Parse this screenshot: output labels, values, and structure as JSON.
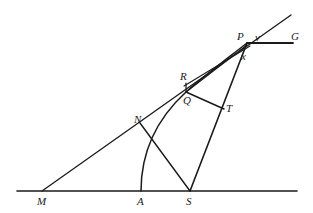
{
  "diagram": {
    "type": "geometric-construction",
    "labels": {
      "P": "P",
      "v": "v",
      "G": "G",
      "x": "x",
      "R": "R",
      "Q": "Q",
      "T": "T",
      "N": "N",
      "M": "M",
      "A": "A",
      "S": "S"
    },
    "points": {
      "M": [
        42,
        191
      ],
      "A": [
        141,
        191
      ],
      "S": [
        190,
        191
      ],
      "N": [
        140,
        126
      ],
      "R": [
        186,
        81
      ],
      "Q": [
        186,
        92
      ],
      "T": [
        224,
        109
      ],
      "P": [
        247,
        43
      ],
      "G": [
        293,
        43
      ],
      "x": [
        240,
        52
      ]
    },
    "segments": [
      {
        "name": "baseline",
        "from": [
          17,
          191
        ],
        "to": [
          297,
          191
        ]
      },
      {
        "name": "tangent-MP",
        "from": [
          42,
          191
        ],
        "to": [
          291,
          15
        ]
      },
      {
        "name": "PG",
        "from": [
          247,
          43
        ],
        "to": [
          293,
          43
        ]
      },
      {
        "name": "SP",
        "from": [
          190,
          191
        ],
        "to": [
          247,
          43
        ]
      },
      {
        "name": "QT",
        "from": [
          186,
          92
        ],
        "to": [
          224,
          109
        ]
      },
      {
        "name": "NS",
        "from": [
          140,
          126
        ],
        "to": [
          190,
          191
        ]
      },
      {
        "name": "RQ",
        "from": [
          186,
          81
        ],
        "to": [
          186,
          92
        ]
      },
      {
        "name": "QP",
        "from": [
          186,
          92
        ],
        "to": [
          247,
          43
        ]
      },
      {
        "name": "Rx",
        "from": [
          186,
          83
        ],
        "to": [
          250,
          44
        ]
      }
    ],
    "curves": [
      {
        "name": "arc-A-Q-P",
        "through": [
          [
            141,
            191
          ],
          [
            150,
            140
          ],
          [
            186,
            92
          ],
          [
            247,
            43
          ]
        ]
      }
    ]
  }
}
